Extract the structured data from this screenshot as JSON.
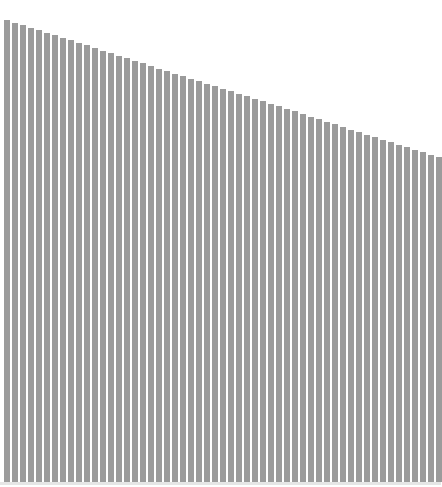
{
  "chart_data": {
    "type": "bar",
    "title": "",
    "xlabel": "",
    "ylabel": "",
    "grid": false,
    "legend": null,
    "bar_color": "#9b9b9b",
    "ylim": [
      0,
      100
    ],
    "categories": [
      1,
      2,
      3,
      4,
      5,
      6,
      7,
      8,
      9,
      10,
      11,
      12,
      13,
      14,
      15,
      16,
      17,
      18,
      19,
      20,
      21,
      22,
      23,
      24,
      25,
      26,
      27,
      28,
      29,
      30,
      31,
      32,
      33,
      34,
      35,
      36,
      37,
      38,
      39,
      40,
      41,
      42,
      43,
      44,
      45,
      46,
      47,
      48,
      49,
      50,
      51,
      52,
      53,
      54,
      55
    ],
    "values": [
      100.0,
      99.4,
      98.9,
      98.3,
      97.8,
      97.2,
      96.7,
      96.1,
      95.6,
      95.0,
      94.5,
      93.9,
      93.4,
      92.8,
      92.3,
      91.7,
      91.2,
      90.6,
      90.1,
      89.5,
      89.0,
      88.4,
      87.9,
      87.3,
      86.8,
      86.2,
      85.7,
      85.1,
      84.6,
      84.0,
      83.5,
      82.9,
      82.4,
      81.8,
      81.3,
      80.7,
      80.2,
      79.6,
      79.1,
      78.5,
      78.0,
      77.4,
      76.9,
      76.3,
      75.8,
      75.2,
      74.7,
      74.1,
      73.6,
      73.0,
      72.5,
      71.9,
      71.4,
      70.8,
      70.3
    ]
  }
}
